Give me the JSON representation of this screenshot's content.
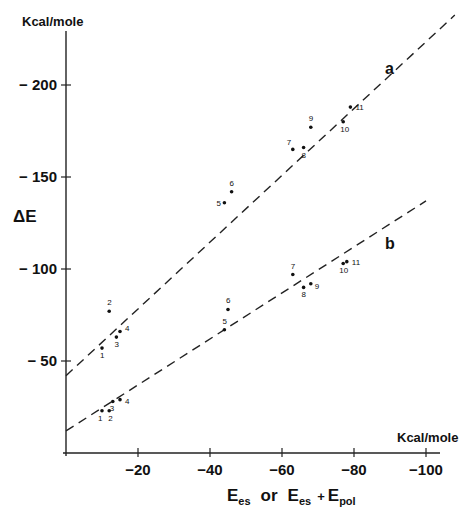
{
  "chart_data": {
    "type": "scatter",
    "title": "",
    "xlabel": "E_es or E_es + E_pol",
    "ylabel": "ΔE",
    "x_unit": "Kcal/mole",
    "y_unit": "Kcal/mole",
    "xlim": [
      0,
      -110
    ],
    "ylim": [
      0,
      -240
    ],
    "x_ticks": [
      -20,
      -40,
      -60,
      -80,
      -100
    ],
    "y_ticks": [
      -50,
      -100,
      -150,
      -200
    ],
    "x_tick_labels": [
      "−20",
      "−40",
      "−60",
      "−80",
      "−100"
    ],
    "y_tick_labels": [
      "− 50",
      "− 100",
      "− 150",
      "− 200"
    ],
    "grid": false,
    "legend": "inline labels a and b",
    "series": [
      {
        "name": "a",
        "points": [
          {
            "label": "1",
            "x": -10,
            "y": -57
          },
          {
            "label": "2",
            "x": -12,
            "y": -77
          },
          {
            "label": "3",
            "x": -14,
            "y": -63
          },
          {
            "label": "4",
            "x": -15,
            "y": -66
          },
          {
            "label": "5",
            "x": -44,
            "y": -136
          },
          {
            "label": "6",
            "x": -46,
            "y": -142
          },
          {
            "label": "7",
            "x": -63,
            "y": -165
          },
          {
            "label": "8",
            "x": -66,
            "y": -166
          },
          {
            "label": "9",
            "x": -68,
            "y": -177
          },
          {
            "label": "10",
            "x": -77,
            "y": -180
          },
          {
            "label": "11",
            "x": -79,
            "y": -188
          }
        ],
        "fit_line": {
          "style": "dashed",
          "x": [
            0,
            -108
          ],
          "y": [
            -42,
            -238
          ]
        }
      },
      {
        "name": "b",
        "points": [
          {
            "label": "1",
            "x": -10,
            "y": -23
          },
          {
            "label": "2",
            "x": -12,
            "y": -23
          },
          {
            "label": "3",
            "x": -13,
            "y": -28
          },
          {
            "label": "4",
            "x": -15,
            "y": -29
          },
          {
            "label": "5",
            "x": -44,
            "y": -67
          },
          {
            "label": "6",
            "x": -45,
            "y": -78
          },
          {
            "label": "7",
            "x": -63,
            "y": -97
          },
          {
            "label": "8",
            "x": -66,
            "y": -90
          },
          {
            "label": "9",
            "x": -68,
            "y": -92
          },
          {
            "label": "10",
            "x": -77,
            "y": -103
          },
          {
            "label": "11",
            "x": -78,
            "y": -104
          }
        ],
        "fit_line": {
          "style": "dashed",
          "x": [
            0,
            -100
          ],
          "y": [
            -12,
            -137
          ]
        }
      }
    ]
  },
  "labels": {
    "y_unit": "Kcal/mole",
    "x_unit": "Kcal/mole",
    "y_title": "ΔE",
    "x_title_main": "E",
    "x_title_sub1": "es",
    "x_title_or": "or",
    "x_title_sub2": "es",
    "x_title_plus": "+",
    "x_title_sub3": "pol",
    "series_a": "a",
    "series_b": "b"
  }
}
